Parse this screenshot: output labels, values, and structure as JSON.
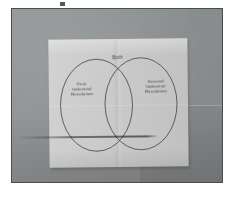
{
  "scene": {
    "subject": "hand-drawn Venn diagram on a sheet of paper",
    "backdrop_color": "#8e9192",
    "paper_color": "#c6c7c6",
    "ink_color": "#34363a",
    "frame_border_color": "#4a4d4f"
  },
  "diagram": {
    "type": "venn",
    "circle_count": 2,
    "left_circle": {
      "label": "First\nIndustrial\nRevolution"
    },
    "right_circle": {
      "label": "Second\nIndustrial\nRevolution"
    },
    "intersection": {
      "label": "Both"
    }
  }
}
